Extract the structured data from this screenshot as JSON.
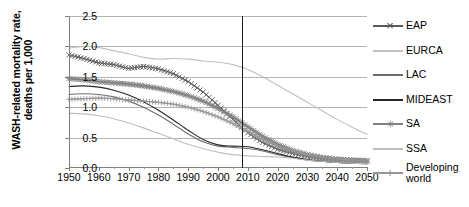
{
  "chart_data": {
    "type": "line",
    "title": "",
    "xlabel": "",
    "ylabel": "WASH-related mortality rate, deaths per 1,000",
    "xlim": [
      1950,
      2050
    ],
    "ylim": [
      0.0,
      2.5
    ],
    "xticks": [
      "1950",
      "1960",
      "1970",
      "1980",
      "1990",
      "2000",
      "2010",
      "2020",
      "2030",
      "2040",
      "2050"
    ],
    "yticks": [
      "0.0",
      "0.5",
      "1.0",
      "1.5",
      "2.0",
      "2.5"
    ],
    "grid": "horizontal",
    "legend_position": "right",
    "annotations": [
      {
        "name": "present-year-marker",
        "type": "vline",
        "x": 2008,
        "color": "#1a1a1a"
      }
    ],
    "x": [
      1950,
      1955,
      1960,
      1965,
      1970,
      1975,
      1980,
      1985,
      1990,
      1995,
      2000,
      2005,
      2010,
      2015,
      2020,
      2025,
      2030,
      2035,
      2040,
      2045,
      2050
    ],
    "series": [
      {
        "name": "EAP",
        "color": "#595959",
        "marker": "x",
        "values": [
          1.86,
          1.8,
          1.73,
          1.7,
          1.64,
          1.67,
          1.63,
          1.55,
          1.42,
          1.25,
          1.03,
          0.8,
          0.58,
          0.42,
          0.31,
          0.24,
          0.19,
          0.16,
          0.14,
          0.13,
          0.12
        ]
      },
      {
        "name": "EURCA",
        "color": "#c0c0c0",
        "marker": "none",
        "values": [
          1.97,
          2.0,
          1.98,
          1.93,
          1.88,
          1.82,
          1.79,
          1.8,
          1.79,
          1.76,
          1.74,
          1.7,
          1.62,
          1.5,
          1.36,
          1.22,
          1.08,
          0.94,
          0.8,
          0.67,
          0.55
        ]
      },
      {
        "name": "LAC",
        "color": "#6e6e6e",
        "marker": "none",
        "values": [
          1.21,
          1.22,
          1.21,
          1.17,
          1.1,
          1.0,
          0.87,
          0.72,
          0.56,
          0.43,
          0.36,
          0.34,
          0.32,
          0.28,
          0.22,
          0.17,
          0.13,
          0.11,
          0.09,
          0.08,
          0.07
        ]
      },
      {
        "name": "MIDEAST",
        "color": "#262626",
        "marker": "none",
        "values": [
          1.34,
          1.35,
          1.33,
          1.28,
          1.2,
          1.09,
          0.95,
          0.79,
          0.62,
          0.47,
          0.38,
          0.36,
          0.35,
          0.3,
          0.24,
          0.18,
          0.14,
          0.11,
          0.09,
          0.08,
          0.07
        ]
      },
      {
        "name": "SA",
        "color": "#808080",
        "marker": "asterisk",
        "values": [
          1.47,
          1.45,
          1.42,
          1.4,
          1.38,
          1.35,
          1.31,
          1.26,
          1.19,
          1.1,
          0.98,
          0.84,
          0.68,
          0.52,
          0.39,
          0.29,
          0.22,
          0.17,
          0.14,
          0.12,
          0.11
        ]
      },
      {
        "name": "SSA",
        "color": "#bdbdbd",
        "marker": "none",
        "values": [
          0.9,
          0.89,
          0.86,
          0.81,
          0.74,
          0.66,
          0.57,
          0.48,
          0.39,
          0.32,
          0.26,
          0.22,
          0.2,
          0.19,
          0.18,
          0.16,
          0.13,
          0.11,
          0.09,
          0.08,
          0.07
        ]
      },
      {
        "name": "Developing world",
        "color": "#969696",
        "marker": "plus",
        "values": [
          1.13,
          1.14,
          1.15,
          1.14,
          1.12,
          1.1,
          1.08,
          1.05,
          1.0,
          0.93,
          0.84,
          0.73,
          0.6,
          0.47,
          0.36,
          0.28,
          0.22,
          0.18,
          0.15,
          0.13,
          0.12
        ]
      }
    ],
    "legend": [
      {
        "label": "EAP",
        "color": "#595959",
        "marker": "x"
      },
      {
        "label": "EURCA",
        "color": "#c0c0c0",
        "marker": "none"
      },
      {
        "label": "LAC",
        "color": "#6e6e6e",
        "marker": "none"
      },
      {
        "label": "MIDEAST",
        "color": "#262626",
        "marker": "none"
      },
      {
        "label": "SA",
        "color": "#808080",
        "marker": "asterisk"
      },
      {
        "label": "SSA",
        "color": "#bdbdbd",
        "marker": "none"
      },
      {
        "label": "Developing world",
        "color": "#969696",
        "marker": "plus"
      }
    ]
  }
}
